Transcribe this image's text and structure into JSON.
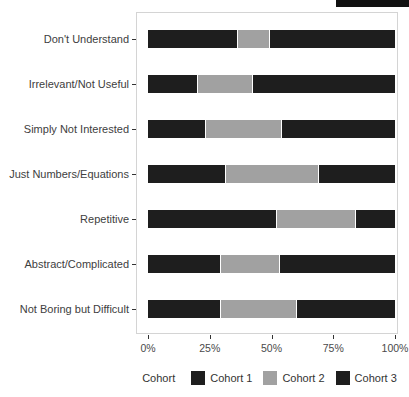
{
  "chart_data": {
    "type": "bar",
    "orientation": "horizontal",
    "stacked": true,
    "title": "",
    "xlabel": "",
    "ylabel": "",
    "xlim": [
      0,
      100
    ],
    "grid": false,
    "categories": [
      "Don't Understand",
      "Irrelevant/Not Useful",
      "Simply Not Interested",
      "Just Numbers/Equations",
      "Repetitive",
      "Abstract/Complicated",
      "Not Boring but Difficult"
    ],
    "series": [
      {
        "name": "Cohort 1",
        "color": "#1e1e1e",
        "values": [
          36,
          20,
          23,
          31,
          52,
          29,
          29
        ]
      },
      {
        "name": "Cohort 2",
        "color": "#a1a1a1",
        "values": [
          13,
          22,
          31,
          38,
          32,
          24,
          31
        ]
      },
      {
        "name": "Cohort 3",
        "color": "#1e1e1e",
        "values": [
          51,
          58,
          46,
          31,
          16,
          47,
          40
        ]
      }
    ],
    "x_tick_values": [
      0,
      25,
      50,
      75,
      100
    ],
    "x_tick_labels": [
      "0%",
      "25%",
      "50%",
      "75%",
      "100%"
    ],
    "legend_title": "Cohort",
    "legend_position": "bottom"
  },
  "colors": {
    "panel_border": "#d4d4d4",
    "axis_text": "#4a4a4a",
    "tick_mark": "#333333",
    "background": "#ffffff",
    "crop_strip": "#111111"
  }
}
